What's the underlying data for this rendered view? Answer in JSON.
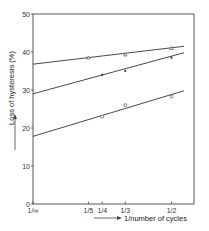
{
  "chart_data": {
    "type": "line",
    "title": "",
    "xlabel": "1/number of cycles",
    "ylabel": "Loss of hysteresis (%)",
    "xlim": [
      0,
      0.585
    ],
    "ylim": [
      0,
      50
    ],
    "grid": false,
    "legend": "none",
    "x_ticks": [
      {
        "value": 0,
        "label": "1/∞"
      },
      {
        "value": 0.2,
        "label": "1/5"
      },
      {
        "value": 0.25,
        "label": "1/4"
      },
      {
        "value": 0.3333,
        "label": "1/3"
      },
      {
        "value": 0.5,
        "label": "1/2"
      }
    ],
    "y_ticks": [
      {
        "value": 0,
        "label": "0"
      },
      {
        "value": 10,
        "label": "10"
      },
      {
        "value": 20,
        "label": "20"
      },
      {
        "value": 30,
        "label": "30"
      },
      {
        "value": 40,
        "label": "40"
      },
      {
        "value": 50,
        "label": "50"
      }
    ],
    "series": [
      {
        "name": "upper (triangles)",
        "marker": "triangle",
        "points": [
          {
            "x": 0.2,
            "y": 38.5
          },
          {
            "x": 0.3333,
            "y": 39.3
          },
          {
            "x": 0.5,
            "y": 41.0
          }
        ],
        "fit_line": [
          {
            "x": 0,
            "y": 36.8
          },
          {
            "x": 0.545,
            "y": 41.5
          }
        ]
      },
      {
        "name": "middle (dots)",
        "marker": "dot",
        "points": [
          {
            "x": 0.25,
            "y": 34.0
          },
          {
            "x": 0.3333,
            "y": 35.0
          },
          {
            "x": 0.5,
            "y": 38.5
          }
        ],
        "fit_line": [
          {
            "x": 0,
            "y": 29.0
          },
          {
            "x": 0.545,
            "y": 39.8
          }
        ]
      },
      {
        "name": "lower (circles)",
        "marker": "circle",
        "points": [
          {
            "x": 0.25,
            "y": 23.0
          },
          {
            "x": 0.3333,
            "y": 26.0
          },
          {
            "x": 0.5,
            "y": 28.3
          }
        ],
        "fit_line": [
          {
            "x": 0,
            "y": 17.8
          },
          {
            "x": 0.545,
            "y": 29.8
          }
        ]
      }
    ]
  }
}
